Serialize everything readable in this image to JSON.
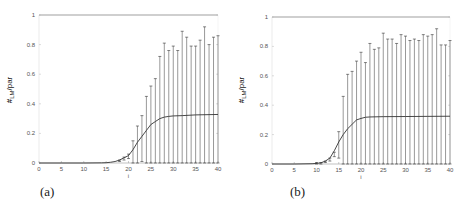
{
  "chart_data": [
    {
      "type": "line",
      "panel_label": "(a)",
      "title": "",
      "xlabel": "i",
      "ylabel": "#_LM/par",
      "xlim": [
        0,
        40
      ],
      "ylim": [
        0,
        1
      ],
      "xticks": [
        0,
        5,
        10,
        15,
        20,
        25,
        30,
        35,
        40
      ],
      "yticks": [
        0,
        0.2,
        0.4,
        0.6,
        0.8,
        1
      ],
      "ytick_labels": [
        "0",
        "0.2",
        "0.4",
        "0.6",
        "0.8",
        "1"
      ],
      "grid": false,
      "series": [
        {
          "name": "mean",
          "x": [
            0,
            5,
            10,
            14,
            15,
            16,
            17,
            18,
            19,
            20,
            21,
            22,
            23,
            24,
            25,
            26,
            27,
            28,
            29,
            30,
            32,
            35,
            40
          ],
          "values": [
            0,
            0,
            0,
            0.001,
            0.002,
            0.005,
            0.01,
            0.02,
            0.035,
            0.05,
            0.09,
            0.14,
            0.18,
            0.22,
            0.26,
            0.28,
            0.3,
            0.31,
            0.315,
            0.318,
            0.32,
            0.325,
            0.328
          ]
        },
        {
          "name": "error_bar_upper",
          "x": [
            18,
            19,
            20,
            21,
            22,
            23,
            24,
            25,
            26,
            27,
            28,
            29,
            30,
            31,
            32,
            33,
            34,
            35,
            36,
            37,
            38,
            39,
            40
          ],
          "values": [
            0.02,
            0.04,
            0.06,
            0.15,
            0.25,
            0.32,
            0.45,
            0.52,
            0.57,
            0.72,
            0.81,
            0.76,
            0.79,
            0.76,
            0.89,
            0.85,
            0.79,
            0.79,
            0.83,
            0.92,
            0.8,
            0.85,
            0.86
          ]
        },
        {
          "name": "error_bar_lower",
          "x": [
            18,
            19,
            20,
            21,
            22,
            23,
            24,
            25,
            26,
            27,
            28,
            29,
            30,
            31,
            32,
            33,
            34,
            35,
            36,
            37,
            38,
            39,
            40
          ],
          "values": [
            0.01,
            0.02,
            0.03,
            0,
            0,
            0.01,
            0,
            0,
            0,
            0,
            0,
            0,
            0,
            0,
            0,
            0,
            0,
            0,
            0,
            0,
            0,
            0,
            0
          ]
        }
      ],
      "reference_line": {
        "y": 1
      }
    },
    {
      "type": "line",
      "panel_label": "(b)",
      "title": "",
      "xlabel": "i",
      "ylabel": "#_LM/par",
      "xlim": [
        0,
        40
      ],
      "ylim": [
        0,
        1
      ],
      "xticks": [
        0,
        5,
        10,
        15,
        20,
        25,
        30,
        35,
        40
      ],
      "yticks": [
        0,
        0.2,
        0.4,
        0.6,
        0.8,
        1
      ],
      "ytick_labels": [
        "0",
        "0.2",
        "0.4",
        "0.6",
        "0.8",
        "1"
      ],
      "grid": false,
      "series": [
        {
          "name": "mean",
          "x": [
            0,
            5,
            9,
            10,
            11,
            12,
            13,
            14,
            15,
            16,
            17,
            18,
            19,
            20,
            21,
            22,
            25,
            30,
            35,
            40
          ],
          "values": [
            0,
            0,
            0.002,
            0.004,
            0.008,
            0.02,
            0.04,
            0.09,
            0.15,
            0.2,
            0.24,
            0.27,
            0.3,
            0.31,
            0.318,
            0.32,
            0.322,
            0.323,
            0.324,
            0.325
          ]
        },
        {
          "name": "error_bar_upper",
          "x": [
            10,
            11,
            12,
            13,
            14,
            15,
            16,
            17,
            18,
            19,
            20,
            21,
            22,
            23,
            24,
            25,
            26,
            27,
            28,
            29,
            30,
            31,
            32,
            33,
            34,
            35,
            36,
            37,
            38,
            39,
            40
          ],
          "values": [
            0.01,
            0.01,
            0.02,
            0.04,
            0.08,
            0.22,
            0.46,
            0.61,
            0.63,
            0.7,
            0.76,
            0.69,
            0.82,
            0.78,
            0.79,
            0.89,
            0.85,
            0.85,
            0.82,
            0.88,
            0.87,
            0.84,
            0.85,
            0.84,
            0.88,
            0.87,
            0.88,
            0.92,
            0.81,
            0.81,
            0.84
          ]
        },
        {
          "name": "error_bar_lower",
          "x": [
            10,
            11,
            12,
            13,
            14,
            15,
            16,
            17,
            18,
            19,
            20,
            21,
            22,
            23,
            24,
            25,
            26,
            27,
            28,
            29,
            30,
            31,
            32,
            33,
            34,
            35,
            36,
            37,
            38,
            39,
            40
          ],
          "values": [
            0,
            0,
            0.01,
            0.02,
            0.05,
            0.04,
            0,
            0,
            0,
            0,
            0,
            0,
            0,
            0,
            0,
            0,
            0,
            0,
            0,
            0,
            0,
            0,
            0,
            0,
            0,
            0,
            0,
            0,
            0,
            0,
            0
          ]
        }
      ],
      "reference_line": {
        "y": 1
      }
    }
  ],
  "panels": [
    {
      "label": "(a)",
      "ylabel_main": "#",
      "ylabel_sub": "LM",
      "ylabel_rest": "/par",
      "xlabel": "i"
    },
    {
      "label": "(b)",
      "ylabel_main": "#",
      "ylabel_sub": "LM",
      "ylabel_rest": "/par",
      "xlabel": "i"
    }
  ],
  "colors": {
    "line": "#333333",
    "axis": "#888888",
    "text": "#555555"
  }
}
